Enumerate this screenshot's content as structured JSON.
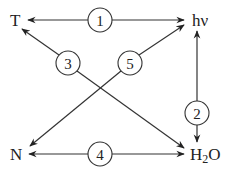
{
  "diagram": {
    "nodes": {
      "T": "T",
      "hv": "hν",
      "N": "N",
      "H2O_main": "H",
      "H2O_sub": "2",
      "H2O_end": "O"
    },
    "edges": [
      {
        "id": "1",
        "label": "1",
        "from": "T",
        "to": "hν",
        "direction": "both"
      },
      {
        "id": "2",
        "label": "2",
        "from": "hν",
        "to": "H2O",
        "direction": "both"
      },
      {
        "id": "3",
        "label": "3",
        "from": "T",
        "to": "H2O",
        "direction": "both"
      },
      {
        "id": "4",
        "label": "4",
        "from": "N",
        "to": "H2O",
        "direction": "both"
      },
      {
        "id": "5",
        "label": "5",
        "from": "N",
        "to": "hν",
        "direction": "both"
      }
    ]
  }
}
